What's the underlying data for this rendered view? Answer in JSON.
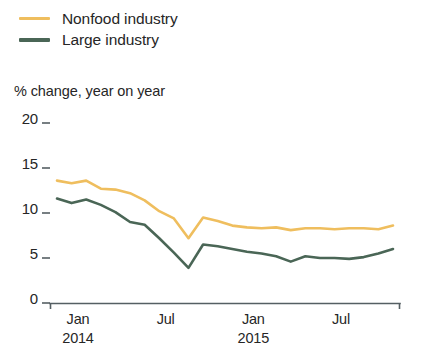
{
  "legend": {
    "items": [
      {
        "label": "Nonfood industry",
        "color": "#efbe5e",
        "name": "legend-item-nonfood-industry"
      },
      {
        "label": "Large industry",
        "color": "#4a6656",
        "name": "legend-item-large-industry"
      }
    ]
  },
  "axis_title": "% change, year on year",
  "chart_data": {
    "type": "line",
    "title": "% change, year on year",
    "subtitle": "",
    "xlabel": "",
    "ylabel": "% change, year on year",
    "ylim": [
      0,
      20
    ],
    "yticks": [
      0,
      5,
      10,
      15,
      20
    ],
    "ytick_labels": [
      "0",
      "5",
      "10",
      "15",
      "20"
    ],
    "grid": false,
    "legend_position": "top-left",
    "x": [
      "Jan 2014",
      "Feb 2014",
      "Mar 2014",
      "Apr 2014",
      "May 2014",
      "Jun 2014",
      "Jul 2014",
      "Aug 2014",
      "Sep 2014",
      "Oct 2014",
      "Nov 2014",
      "Dec 2014",
      "Jan 2015",
      "Feb 2015",
      "Mar 2015",
      "Apr 2015",
      "May 2015",
      "Jun 2015",
      "Jul 2015",
      "Aug 2015",
      "Sep 2015",
      "Oct 2015",
      "Nov 2015",
      "Dec 2015"
    ],
    "xtick_labels": [
      {
        "month": "Jan",
        "year": "2014"
      },
      {
        "month": "Jul",
        "year": ""
      },
      {
        "month": "Jan",
        "year": "2015"
      },
      {
        "month": "Jul",
        "year": ""
      }
    ],
    "series": [
      {
        "name": "Nonfood industry",
        "color": "#efbe5e",
        "values": [
          13.6,
          13.3,
          13.6,
          12.7,
          12.6,
          12.2,
          11.4,
          10.2,
          9.4,
          7.2,
          9.5,
          9.1,
          8.6,
          8.4,
          8.3,
          8.4,
          8.1,
          8.3,
          8.3,
          8.2,
          8.3,
          8.3,
          8.2,
          8.6
        ]
      },
      {
        "name": "Large industry",
        "color": "#4a6656",
        "values": [
          11.6,
          11.1,
          11.5,
          10.9,
          10.1,
          9.0,
          8.7,
          7.2,
          5.6,
          3.9,
          6.5,
          6.3,
          6.0,
          5.7,
          5.5,
          5.2,
          4.6,
          5.2,
          5.0,
          5.0,
          4.9,
          5.1,
          5.5,
          6.0
        ]
      }
    ]
  }
}
